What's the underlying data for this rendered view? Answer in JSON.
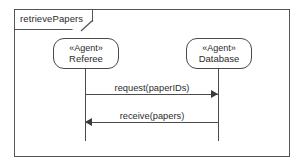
{
  "diagram": {
    "type": "uml-sequence-diagram",
    "frame_label": "retrievePapers",
    "lifelines": [
      {
        "id": "referee",
        "stereotype": "«Agent»",
        "name": "Referee",
        "x": 52,
        "axis_x": 84
      },
      {
        "id": "database",
        "stereotype": "«Agent»",
        "name": "Database",
        "x": 185,
        "axis_x": 217
      }
    ],
    "messages": [
      {
        "id": "request",
        "label": "request(paperIDs)",
        "from": "referee",
        "to": "database",
        "direction": "right",
        "y": 93
      },
      {
        "id": "receive",
        "label": "receive(papers)",
        "from": "database",
        "to": "referee",
        "direction": "left",
        "y": 121
      }
    ],
    "colors": {
      "stroke": "#4a4a4a",
      "frame_stroke": "#555555",
      "text": "#2b2b2b",
      "background": "#ffffff"
    }
  }
}
